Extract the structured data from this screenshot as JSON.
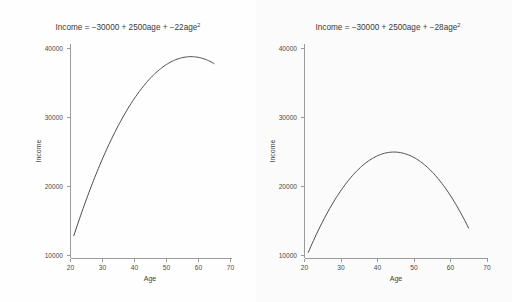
{
  "figure": {
    "background_color": "#fdfdfd",
    "panel_count": 2
  },
  "chart_data": [
    {
      "type": "line",
      "panel": "left",
      "title": "Income = −30000 + 2500age + −22age",
      "title_exponent": "2",
      "xlabel": "Age",
      "ylabel": "Income",
      "xlim": [
        20,
        70
      ],
      "ylim": [
        9000,
        42500
      ],
      "xticks": [
        20,
        30,
        40,
        50,
        60,
        70
      ],
      "xtick_labels": [
        "20",
        "30",
        "40",
        "50",
        "60",
        "70"
      ],
      "yticks": [
        10000,
        20000,
        30000,
        40000
      ],
      "ytick_labels": [
        "10000",
        "20000",
        "30000",
        "40000"
      ],
      "grid": false,
      "legend": "none",
      "equation": {
        "intercept": -30000,
        "linear": 2500,
        "quadratic": -22
      },
      "x": [
        21,
        23,
        25,
        27,
        29,
        31,
        33,
        35,
        37,
        39,
        41,
        43,
        45,
        47,
        49,
        51,
        53,
        55,
        57,
        59,
        61,
        63,
        65
      ],
      "values": [
        12798,
        16362,
        19750,
        22962,
        25998,
        28858,
        31542,
        34050,
        36382,
        38538,
        40518,
        42322,
        43950,
        45402,
        46678,
        47778,
        48702,
        49450,
        50022,
        50418,
        50638,
        50682,
        50550
      ],
      "series_note": "rendered curve peak near age 57 at approximately 41000",
      "curve_points_plot": [
        [
          21,
          12500
        ],
        [
          25,
          18200
        ],
        [
          30,
          24300
        ],
        [
          35,
          29300
        ],
        [
          40,
          33500
        ],
        [
          45,
          36900
        ],
        [
          50,
          39300
        ],
        [
          55,
          40700
        ],
        [
          57,
          41000
        ],
        [
          60,
          40700
        ],
        [
          63,
          40000
        ],
        [
          65,
          39400
        ]
      ]
    },
    {
      "type": "line",
      "panel": "right",
      "title": "Income = −30000 + 2500age + −28age",
      "title_exponent": "2",
      "xlabel": "Age",
      "ylabel": "Income",
      "xlim": [
        20,
        70
      ],
      "ylim": [
        9000,
        42500
      ],
      "xticks": [
        20,
        30,
        40,
        50,
        60,
        70
      ],
      "xtick_labels": [
        "20",
        "30",
        "40",
        "50",
        "60",
        "70"
      ],
      "yticks": [
        10000,
        20000,
        30000,
        40000
      ],
      "ytick_labels": [
        "10000",
        "20000",
        "30000",
        "40000"
      ],
      "grid": false,
      "legend": "none",
      "equation": {
        "intercept": -30000,
        "linear": 2500,
        "quadratic": -28
      },
      "x": [
        21,
        23,
        25,
        27,
        29,
        31,
        33,
        35,
        37,
        39,
        41,
        43,
        45,
        47,
        49,
        51,
        53,
        55,
        57,
        59,
        61,
        63,
        65
      ],
      "values": [
        10152,
        12688,
        15000,
        17088,
        18952,
        20592,
        22008,
        23200,
        24168,
        24912,
        25432,
        25728,
        25800,
        25648,
        25272,
        24672,
        23848,
        22800,
        21528,
        20032,
        18312,
        16368,
        14200
      ],
      "series_note": "rendered curve peak near age 45 at approximately 25500",
      "curve_points_plot": [
        [
          21,
          9900
        ],
        [
          25,
          15000
        ],
        [
          30,
          19300
        ],
        [
          35,
          22400
        ],
        [
          40,
          24500
        ],
        [
          45,
          25500
        ],
        [
          47,
          25450
        ],
        [
          50,
          25000
        ],
        [
          55,
          23200
        ],
        [
          60,
          19800
        ],
        [
          63,
          16800
        ],
        [
          65,
          13700
        ]
      ]
    }
  ],
  "panels": {
    "left": {
      "name": "income-age-quadratic-22",
      "title_prefix": "Income = −30000 + 2500age + −22age",
      "exponent": "2",
      "y_axis_title": "Income",
      "x_axis_title": "Age"
    },
    "right": {
      "name": "income-age-quadratic-28",
      "title_prefix": "Income = −30000 + 2500age + −28age",
      "exponent": "2",
      "y_axis_title": "Income",
      "x_axis_title": "Age"
    }
  },
  "style": {
    "curve_color": "#4b4b4b",
    "axis_color": "#9a9a9a",
    "text_color": "#3a3a3a"
  }
}
